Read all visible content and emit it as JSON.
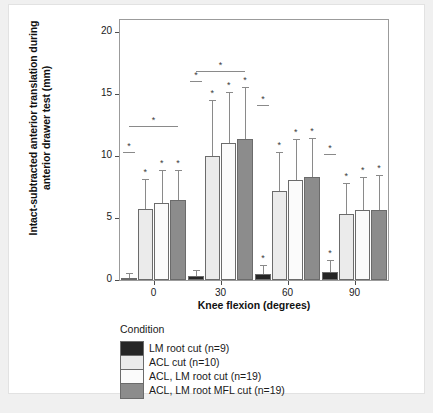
{
  "chart_data": {
    "type": "bar",
    "title": "",
    "xlabel": "Knee flexion (degrees)",
    "ylabel": "Intact-subtracted anterior translation during anterior drawer test (mm)",
    "categories": [
      "0",
      "30",
      "60",
      "90"
    ],
    "ylim": [
      0,
      21
    ],
    "yticks": [
      0,
      5,
      10,
      15,
      20
    ],
    "yticklabels": [
      "0",
      "5",
      "10",
      "15",
      "20"
    ],
    "grid": false,
    "legend_position": "below",
    "legend_title": "Condition",
    "series": [
      {
        "name": "LM root cut (n=9)",
        "color": "#262626",
        "values": [
          0.2,
          0.3,
          0.45,
          0.65
        ],
        "errors": [
          0.35,
          0.5,
          0.75,
          0.95
        ],
        "significance": [
          false,
          false,
          true,
          true
        ]
      },
      {
        "name": "ACL cut (n=10)",
        "color": "#ebebeb",
        "values": [
          5.75,
          10.0,
          7.2,
          5.35
        ],
        "errors": [
          2.4,
          4.5,
          3.1,
          2.5
        ],
        "significance": [
          true,
          true,
          true,
          true
        ]
      },
      {
        "name": "ACL, LM root cut (n=19)",
        "color": "#fbfbfb",
        "values": [
          6.25,
          11.1,
          8.05,
          5.65
        ],
        "errors": [
          2.6,
          4.1,
          3.3,
          2.7
        ],
        "significance": [
          true,
          true,
          true,
          true
        ]
      },
      {
        "name": "ACL, LM root MFL cut (n=19)",
        "color": "#8c8c8c",
        "values": [
          6.5,
          11.35,
          8.3,
          5.65
        ],
        "errors": [
          2.35,
          4.2,
          3.2,
          2.8
        ],
        "significance": [
          true,
          true,
          true,
          true
        ]
      }
    ],
    "significance_brackets": [
      {
        "group": "0",
        "from": 0,
        "to": 0,
        "y": 10.3,
        "label": "*"
      },
      {
        "group": "0",
        "from": 0,
        "to": 3,
        "y": 12.4,
        "label": "*"
      },
      {
        "group": "30",
        "from": 0,
        "to": 0,
        "y": 16.1,
        "label": "*"
      },
      {
        "group": "30",
        "from": 0,
        "to": 3,
        "y": 16.9,
        "label": "*"
      },
      {
        "group": "60",
        "from": 0,
        "to": 0,
        "y": 14.1,
        "label": "*"
      },
      {
        "group": "90",
        "from": 0,
        "to": 0,
        "y": 10.2,
        "label": "*"
      }
    ]
  },
  "legend": {
    "title": "Condition",
    "items": [
      {
        "label": "LM root cut (n=9)",
        "color": "#262626"
      },
      {
        "label": "ACL cut (n=10)",
        "color": "#ebebeb"
      },
      {
        "label": "ACL, LM root cut (n=19)",
        "color": "#fbfbfb"
      },
      {
        "label": "ACL, LM root MFL cut (n=19)",
        "color": "#8c8c8c"
      }
    ]
  },
  "colors": {
    "axis": "#4d4d4d",
    "panel_border": "#9b9b9b",
    "bar_outline": "#6b6b6b",
    "error_bar": "#8a8a8a",
    "text": "#1a1a1a",
    "page_background": "#f0f0f0",
    "card_background": "#ffffff"
  }
}
